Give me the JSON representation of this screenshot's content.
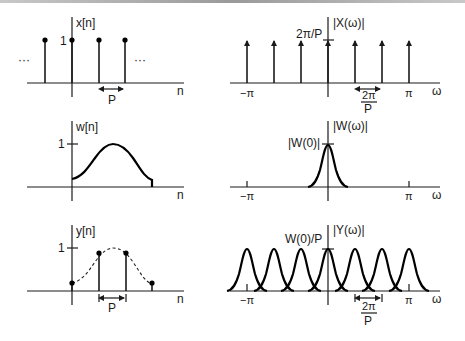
{
  "figure": {
    "panels": {
      "x_time": {
        "ylabel": "x[n]",
        "xlabel": "n",
        "tick_one": "1",
        "ellipsis_left": "···",
        "ellipsis_right": "···",
        "spacing_label": "P",
        "impulses_x": [
          45,
          72,
          99,
          125
        ]
      },
      "x_freq": {
        "ylabel": "|X(ω)|",
        "xlabel": "ω",
        "height_label": "2π/P",
        "tick_neg_pi": "−π",
        "tick_pi": "π",
        "spacing_num": "2π",
        "spacing_den": "P",
        "impulses_x": [
          247,
          274,
          301,
          328,
          355,
          382,
          409
        ]
      },
      "w_time": {
        "ylabel": "w[n]",
        "xlabel": "n",
        "tick_one": "1"
      },
      "w_freq": {
        "ylabel": "|W(ω)|",
        "xlabel": "ω",
        "peak_label": "|W(0)|",
        "tick_neg_pi": "−π",
        "tick_pi": "π"
      },
      "y_time": {
        "ylabel": "y[n]",
        "xlabel": "n",
        "tick_one": "1",
        "spacing_label": "P",
        "samples": [
          {
            "x": 72,
            "y": 283
          },
          {
            "x": 99,
            "y": 253
          },
          {
            "x": 126,
            "y": 253
          },
          {
            "x": 152,
            "y": 283
          }
        ]
      },
      "y_freq": {
        "ylabel": "|Y(ω)|",
        "xlabel": "ω",
        "peak_label": "W(0)/P",
        "tick_neg_pi": "−π",
        "tick_pi": "π",
        "spacing_num": "2π",
        "spacing_den": "P",
        "peaks_x": [
          247,
          274,
          301,
          328,
          355,
          382,
          409
        ]
      }
    }
  }
}
